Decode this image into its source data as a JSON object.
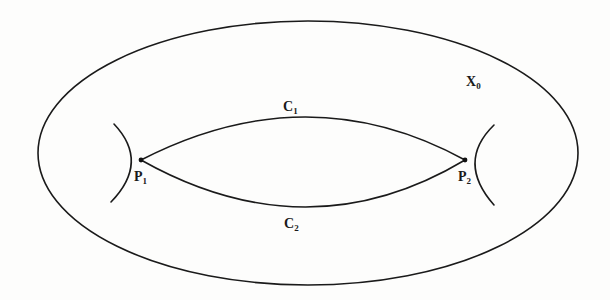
{
  "figure": {
    "labels": {
      "surface": {
        "base": "X",
        "sub": "0"
      },
      "curve_top": {
        "base": "C",
        "sub": "1"
      },
      "curve_bottom": {
        "base": "C",
        "sub": "2"
      },
      "point_left": {
        "base": "P",
        "sub": "1"
      },
      "point_right": {
        "base": "P",
        "sub": "2"
      }
    },
    "geometry": {
      "outer_ellipse": {
        "cx": 308,
        "cy": 153,
        "rx": 270,
        "ry": 132
      },
      "P1": [
        141,
        160
      ],
      "P2": [
        465,
        160
      ],
      "C1_peak": [
        308,
        117
      ],
      "C2_bottom": [
        308,
        207
      ]
    },
    "colors": {
      "stroke": "#1a1a1a",
      "background": "#fdfdfc"
    }
  }
}
